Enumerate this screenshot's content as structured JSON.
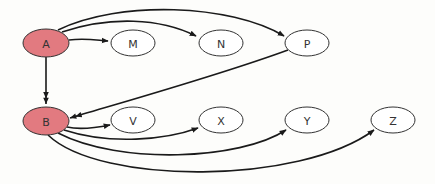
{
  "diagram": {
    "type": "directed-graph",
    "colors": {
      "highlight_fill": "#e27a80",
      "normal_fill": "#ffffff",
      "stroke": "#333333",
      "edge": "#1a1a1a",
      "background": "#fdfdfb"
    },
    "nodes": [
      {
        "id": "A",
        "label": "A",
        "cx": 46,
        "cy": 43,
        "rx": 23,
        "ry": 14,
        "highlighted": true
      },
      {
        "id": "M",
        "label": "M",
        "cx": 133,
        "cy": 43,
        "rx": 22,
        "ry": 13,
        "highlighted": false
      },
      {
        "id": "N",
        "label": "N",
        "cx": 221,
        "cy": 43,
        "rx": 22,
        "ry": 13,
        "highlighted": false
      },
      {
        "id": "P",
        "label": "P",
        "cx": 307,
        "cy": 43,
        "rx": 22,
        "ry": 13,
        "highlighted": false
      },
      {
        "id": "B",
        "label": "B",
        "cx": 46,
        "cy": 121,
        "rx": 23,
        "ry": 14,
        "highlighted": true
      },
      {
        "id": "V",
        "label": "V",
        "cx": 133,
        "cy": 120,
        "rx": 22,
        "ry": 13,
        "highlighted": false
      },
      {
        "id": "X",
        "label": "X",
        "cx": 221,
        "cy": 120,
        "rx": 22,
        "ry": 13,
        "highlighted": false
      },
      {
        "id": "Y",
        "label": "Y",
        "cx": 307,
        "cy": 120,
        "rx": 22,
        "ry": 13,
        "highlighted": false
      },
      {
        "id": "Z",
        "label": "Z",
        "cx": 393,
        "cy": 120,
        "rx": 22,
        "ry": 13,
        "highlighted": false
      }
    ],
    "edges": [
      {
        "from": "A",
        "to": "M",
        "path": "M69,40 C85,38 95,40 108,41",
        "double_head": false
      },
      {
        "from": "A",
        "to": "N",
        "path": "M62,32 C110,16 160,18 196,36",
        "double_head": false
      },
      {
        "from": "A",
        "to": "P",
        "path": "M58,30 C120,0 230,4 284,36",
        "double_head": false
      },
      {
        "from": "A",
        "to": "B",
        "path": "M46,57 L46,104",
        "double_head": true
      },
      {
        "from": "P",
        "to": "B",
        "path": "M288,50 C220,75 130,100 70,118",
        "double_head": true
      },
      {
        "from": "B",
        "to": "V",
        "path": "M67,127 C80,130 95,128 110,125",
        "double_head": false
      },
      {
        "from": "B",
        "to": "X",
        "path": "M64,130 C110,145 165,140 198,128",
        "double_head": false
      },
      {
        "from": "B",
        "to": "Y",
        "path": "M58,133 C120,165 240,160 286,130",
        "double_head": false
      },
      {
        "from": "B",
        "to": "Z",
        "path": "M48,135 C100,185 300,185 374,130",
        "double_head": false
      }
    ]
  }
}
